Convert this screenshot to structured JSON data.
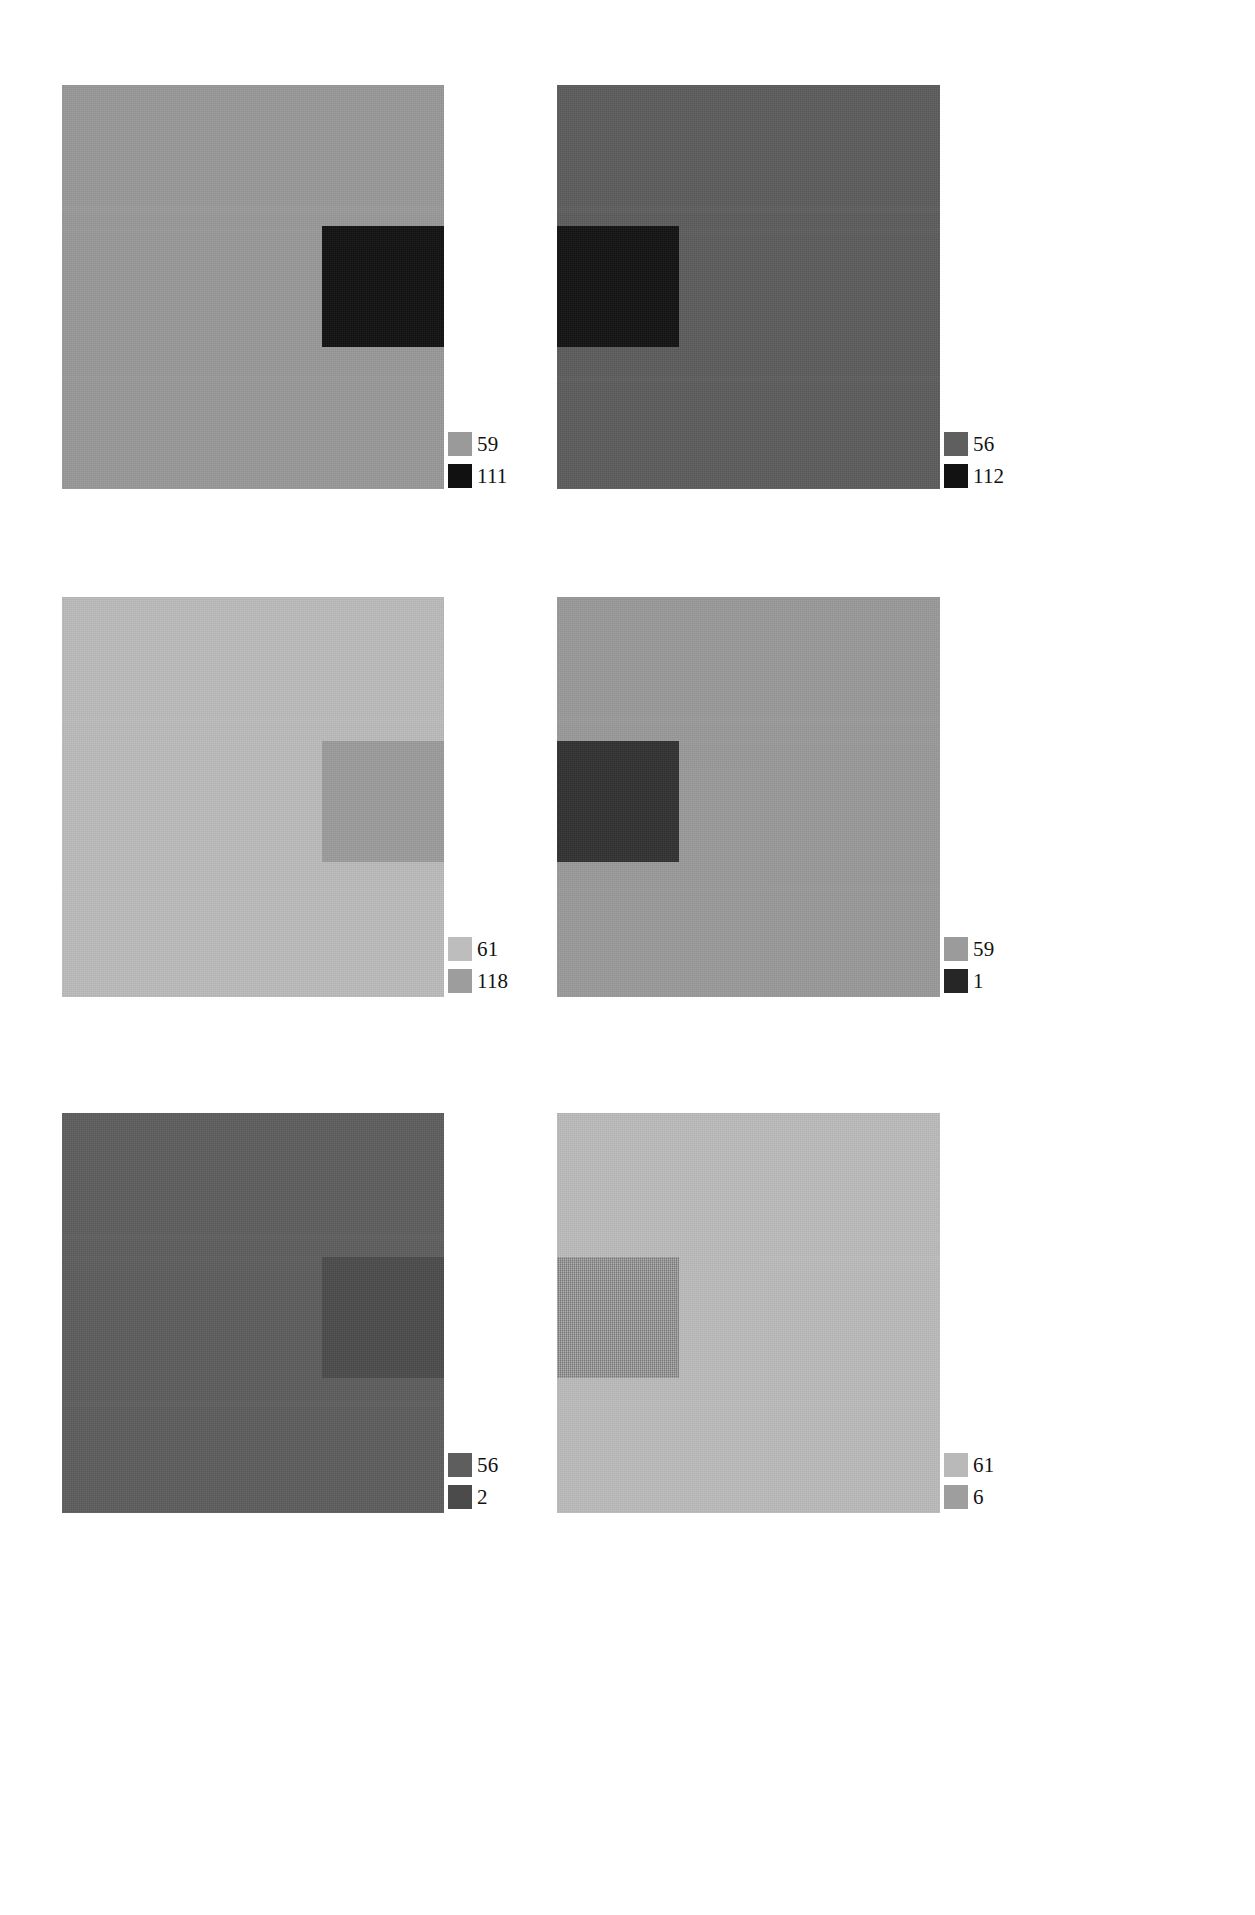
{
  "figure": {
    "type": "image-panel-grid",
    "columns": 2,
    "rows": 3,
    "background_color": "#ffffff"
  },
  "panels": [
    {
      "id": "panel-1",
      "position": "top-left",
      "frame": {
        "x": 62,
        "y": 85,
        "w": 382,
        "h": 404
      },
      "background": {
        "color": "#999999",
        "label": "59"
      },
      "inner_square": {
        "color": "#121212",
        "label": "111",
        "x": 260,
        "y": 141,
        "w": 122,
        "h": 121,
        "textured": false
      },
      "legend": {
        "x": 386,
        "y": 346,
        "items": [
          {
            "swatch_color": "#9a9a9a",
            "label": "59"
          },
          {
            "swatch_color": "#111111",
            "label": "111"
          }
        ]
      }
    },
    {
      "id": "panel-2",
      "position": "top-right",
      "frame": {
        "x": 557,
        "y": 85,
        "w": 383,
        "h": 404
      },
      "background": {
        "color": "#5d5d5d",
        "label": "56"
      },
      "inner_square": {
        "color": "#131313",
        "label": "112",
        "x": 0,
        "y": 141,
        "w": 122,
        "h": 121,
        "textured": false
      },
      "legend": {
        "x": 387,
        "y": 346,
        "items": [
          {
            "swatch_color": "#5f5f5f",
            "label": "56"
          },
          {
            "swatch_color": "#121212",
            "label": "112"
          }
        ]
      }
    },
    {
      "id": "panel-3",
      "position": "middle-left",
      "frame": {
        "x": 62,
        "y": 597,
        "w": 382,
        "h": 400
      },
      "background": {
        "color": "#bcbcbc",
        "label": "61"
      },
      "inner_square": {
        "color": "#9c9c9c",
        "label": "118",
        "x": 260,
        "y": 144,
        "w": 122,
        "h": 121,
        "textured": false
      },
      "legend": {
        "x": 386,
        "y": 339,
        "items": [
          {
            "swatch_color": "#bdbdbd",
            "label": "61"
          },
          {
            "swatch_color": "#9d9d9d",
            "label": "118"
          }
        ]
      }
    },
    {
      "id": "panel-4",
      "position": "middle-right",
      "frame": {
        "x": 557,
        "y": 597,
        "w": 383,
        "h": 400
      },
      "background": {
        "color": "#9a9a9a",
        "label": "59"
      },
      "inner_square": {
        "color": "#323232",
        "label": "1",
        "x": 0,
        "y": 144,
        "w": 122,
        "h": 121,
        "textured": false
      },
      "legend": {
        "x": 387,
        "y": 339,
        "items": [
          {
            "swatch_color": "#9b9b9b",
            "label": "59"
          },
          {
            "swatch_color": "#262626",
            "label": "1"
          }
        ]
      }
    },
    {
      "id": "panel-5",
      "position": "bottom-left",
      "frame": {
        "x": 62,
        "y": 1113,
        "w": 382,
        "h": 400
      },
      "background": {
        "color": "#5e5e5e",
        "label": "56"
      },
      "inner_square": {
        "color": "#4c4c4c",
        "label": "2",
        "x": 260,
        "y": 144,
        "w": 122,
        "h": 121,
        "textured": false
      },
      "legend": {
        "x": 386,
        "y": 339,
        "items": [
          {
            "swatch_color": "#5e5e5e",
            "label": "56"
          },
          {
            "swatch_color": "#4b4b4b",
            "label": "2"
          }
        ]
      }
    },
    {
      "id": "panel-6",
      "position": "bottom-right",
      "frame": {
        "x": 557,
        "y": 1113,
        "w": 383,
        "h": 400
      },
      "background": {
        "color": "#bcbcbc",
        "label": "61"
      },
      "inner_square": {
        "color": "#9c9c9c",
        "label": "6",
        "x": 0,
        "y": 144,
        "w": 122,
        "h": 121,
        "textured": true
      },
      "legend": {
        "x": 387,
        "y": 339,
        "items": [
          {
            "swatch_color": "#b9b9b9",
            "label": "61"
          },
          {
            "swatch_color": "#9e9e9e",
            "label": "6"
          }
        ]
      }
    }
  ]
}
